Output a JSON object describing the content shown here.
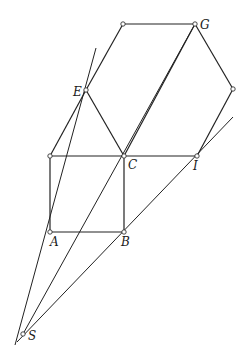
{
  "diagram": {
    "title": "",
    "points": {
      "A": {
        "label": "A",
        "x": 50,
        "y": 232
      },
      "B": {
        "label": "B",
        "x": 124,
        "y": 232
      },
      "C": {
        "label": "C",
        "x": 124,
        "y": 156
      },
      "D": {
        "label": "",
        "x": 50,
        "y": 156
      },
      "E": {
        "label": "E",
        "x": 86,
        "y": 90
      },
      "F": {
        "label": "",
        "x": 123,
        "y": 24
      },
      "G": {
        "label": "G",
        "x": 195,
        "y": 24
      },
      "H": {
        "label": "",
        "x": 233,
        "y": 89
      },
      "I": {
        "label": "I",
        "x": 197,
        "y": 156
      },
      "S": {
        "label": "S",
        "x": 23,
        "y": 334
      }
    },
    "labels": {
      "A": "A",
      "B": "B",
      "C": "C",
      "E": "E",
      "G": "G",
      "I": "I",
      "S": "S"
    }
  }
}
